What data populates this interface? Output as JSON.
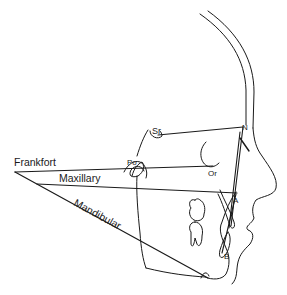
{
  "figure": {
    "type": "cephalometric tracing (lateral skull profile)",
    "labels": {
      "frankfort": "Frankfort",
      "maxillary": "Maxillary",
      "mandibular": "Mandibular"
    },
    "landmarks": {
      "sella": "Sr",
      "nasion": "N",
      "porion": "Po",
      "orbitale": "Or",
      "point_a": "A",
      "point_b": "B"
    },
    "colors": {
      "line": "#1a1a1a",
      "background": "#ffffff"
    }
  }
}
